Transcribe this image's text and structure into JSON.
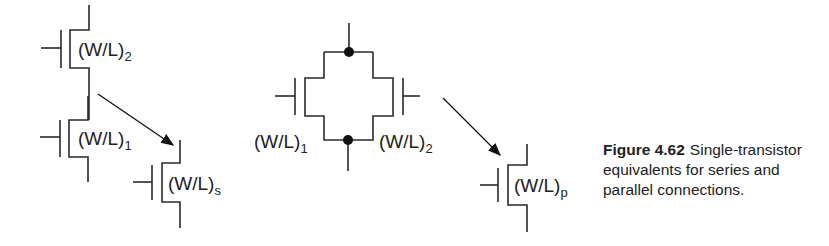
{
  "caption": {
    "figure_number": "Figure 4.62",
    "text": "Single-transistor equivalents for series and parallel connections."
  },
  "series": {
    "top_transistor": {
      "label": "(W/L)",
      "subscript": "2"
    },
    "bottom_transistor": {
      "label": "(W/L)",
      "subscript": "1"
    },
    "equivalent": {
      "label": "(W/L)",
      "subscript": "s"
    }
  },
  "parallel": {
    "left_transistor": {
      "label": "(W/L)",
      "subscript": "1"
    },
    "right_transistor": {
      "label": "(W/L)",
      "subscript": "2"
    },
    "equivalent": {
      "label": "(W/L)",
      "subscript": "p"
    }
  },
  "colors": {
    "line": "#2a2a2a",
    "text": "#222222",
    "background": "#ffffff"
  }
}
